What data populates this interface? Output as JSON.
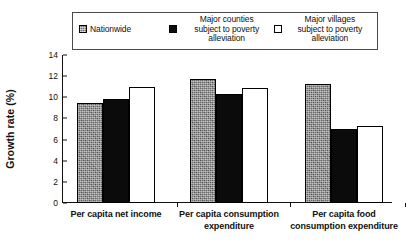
{
  "chart_data": {
    "type": "bar",
    "title": "",
    "xlabel": "",
    "ylabel": "Growth rate (%)",
    "ylim": [
      0,
      14
    ],
    "yticks": [
      0,
      2,
      4,
      6,
      8,
      10,
      12,
      14
    ],
    "grid": false,
    "legend_position": "top",
    "categories": [
      "Per capita net income",
      "Per capita consumption expenditure",
      "Per capita food consumption expenditure"
    ],
    "category_lines": [
      [
        "Per capita net income"
      ],
      [
        "Per capita consumption",
        "expenditure"
      ],
      [
        "Per capita food",
        "consumption  expenditure"
      ]
    ],
    "series": [
      {
        "name": "Nationwide",
        "name_lines": [
          "Nationwide"
        ],
        "swatch": "gray",
        "color": "#707070",
        "values": [
          9.5,
          11.7,
          11.3
        ]
      },
      {
        "name": "Major counties subject to poverty alleviation",
        "name_lines": [
          "Major counties",
          "subject to poverty",
          "alleviation"
        ],
        "swatch": "black",
        "color": "#0b0b0b",
        "values": [
          9.8,
          10.3,
          7.0
        ]
      },
      {
        "name": "Major villages subject to poverty alleviation",
        "name_lines": [
          "Major villages",
          "subject to poverty",
          "alleviation"
        ],
        "swatch": "white",
        "color": "#ffffff",
        "values": [
          11.0,
          10.9,
          7.25
        ]
      }
    ]
  },
  "axis": {
    "y_label": "Growth rate (%)",
    "y_ticks": [
      "14",
      "12",
      "10",
      "8",
      "6",
      "4",
      "2",
      "0"
    ]
  },
  "legend": {
    "entries": [
      {
        "swatch": "gray",
        "lines": [
          "Nationwide"
        ]
      },
      {
        "swatch": "black",
        "lines": [
          "Major counties",
          "subject to poverty",
          "alleviation"
        ]
      },
      {
        "swatch": "white",
        "lines": [
          "Major villages",
          "subject to poverty",
          "alleviation"
        ]
      }
    ]
  }
}
